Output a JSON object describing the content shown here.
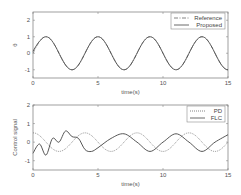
{
  "chart_data": [
    {
      "type": "line",
      "title": "",
      "xlabel": "time(s)",
      "ylabel": "θ",
      "xlim": [
        0,
        15
      ],
      "ylim": [
        -1.5,
        2.5
      ],
      "xticks": [
        0,
        5,
        10,
        15
      ],
      "yticks": [
        -1,
        0,
        1,
        2
      ],
      "grid": false,
      "legend_position": "upper right",
      "series": [
        {
          "name": "Reference",
          "style": "dash-dot",
          "description": "sin(pi*t/2)",
          "x": [
            0,
            1,
            3,
            5,
            7,
            9,
            11,
            13,
            15
          ],
          "values": [
            0,
            1,
            -1,
            1,
            -1,
            1,
            -1,
            1,
            -1
          ]
        },
        {
          "name": "Proposed",
          "style": "solid",
          "description": "tracks reference",
          "x": [
            0,
            0.2,
            1,
            3,
            5,
            7,
            9,
            11,
            13,
            15
          ],
          "values": [
            0.1,
            0.4,
            1,
            -1,
            1,
            -1,
            1,
            -1,
            1,
            -1
          ]
        }
      ]
    },
    {
      "type": "line",
      "title": "",
      "xlabel": "time(s)",
      "ylabel": "Control signal",
      "xlim": [
        0,
        15
      ],
      "ylim": [
        -1.5,
        2
      ],
      "xticks": [
        0,
        5,
        10,
        15
      ],
      "yticks": [
        -1,
        0,
        1,
        2
      ],
      "grid": false,
      "legend_position": "upper right",
      "series": [
        {
          "name": "PD",
          "style": "dotted",
          "description": "0.5*cos(pi*t/2)",
          "x": [
            0,
            2,
            4,
            6,
            8,
            10,
            12,
            14
          ],
          "values": [
            0.5,
            -0.5,
            0.5,
            -0.5,
            0.5,
            -0.5,
            0.5,
            -0.5
          ]
        },
        {
          "name": "FLC",
          "style": "solid",
          "x": [
            0,
            0.5,
            1,
            1.5,
            2,
            2.5,
            3,
            3.5,
            4,
            4.5,
            5,
            6,
            7,
            8,
            9,
            10,
            11,
            12,
            13,
            14,
            15
          ],
          "values": [
            -0.6,
            -0.1,
            -0.7,
            0.2,
            0.0,
            0.6,
            0.3,
            0.2,
            -0.4,
            -0.5,
            -0.3,
            0.2,
            0.45,
            0.0,
            -0.5,
            0.0,
            0.45,
            0.0,
            -0.5,
            0.0,
            0.4
          ]
        }
      ]
    }
  ]
}
